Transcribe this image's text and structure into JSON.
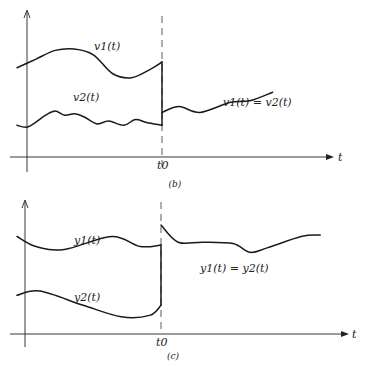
{
  "panels": [
    {
      "id": "b",
      "caption": "(b)",
      "t_label": "t",
      "t0_label": "t0",
      "labels": {
        "curve1": "v1(t)",
        "curve2": "v2(t)",
        "merged": "v1(t) = v2(t)"
      },
      "curve1": [
        [
          0,
          6.2
        ],
        [
          1,
          6.8
        ],
        [
          2,
          7.4
        ],
        [
          3,
          7.5
        ],
        [
          4,
          7.1
        ],
        [
          5,
          5.8
        ],
        [
          6,
          5.5
        ],
        [
          7,
          6.1
        ],
        [
          7.6,
          6.6
        ]
      ],
      "curve2": [
        [
          0,
          2.2
        ],
        [
          0.6,
          2.1
        ],
        [
          1.5,
          2.9
        ],
        [
          2,
          3.2
        ],
        [
          2.5,
          2.9
        ],
        [
          3,
          3.0
        ],
        [
          3.5,
          2.8
        ],
        [
          4.2,
          2.3
        ],
        [
          4.8,
          2.5
        ],
        [
          5.6,
          2.2
        ],
        [
          6.2,
          2.6
        ],
        [
          6.8,
          2.4
        ],
        [
          7.6,
          2.2
        ]
      ],
      "merged": [
        [
          7.6,
          3.1
        ],
        [
          8.5,
          3.5
        ],
        [
          9.6,
          3.1
        ],
        [
          11.2,
          3.8
        ],
        [
          12.2,
          3.9
        ],
        [
          13.4,
          4.5
        ]
      ]
    },
    {
      "id": "c",
      "caption": "(c)",
      "t_label": "t",
      "t0_label": "t0",
      "labels": {
        "curve1": "y1(t)",
        "curve2": "y2(t)",
        "merged": "y1(t) = y2(t)"
      },
      "curve1": [
        [
          0,
          6.8
        ],
        [
          1,
          6.1
        ],
        [
          2.5,
          5.9
        ],
        [
          5,
          6.8
        ],
        [
          6.5,
          6.1
        ],
        [
          7.6,
          6.2
        ]
      ],
      "curve2": [
        [
          0,
          2.7
        ],
        [
          1.2,
          3.0
        ],
        [
          3.5,
          2.0
        ],
        [
          5.5,
          1.2
        ],
        [
          7,
          1.3
        ],
        [
          7.6,
          2.0
        ]
      ],
      "merged": [
        [
          7.6,
          7.6
        ],
        [
          8.5,
          6.4
        ],
        [
          9.8,
          6.4
        ],
        [
          11.4,
          6.3
        ],
        [
          12.3,
          5.7
        ],
        [
          13.2,
          6.0
        ],
        [
          15,
          6.8
        ],
        [
          16,
          6.9
        ]
      ]
    }
  ]
}
